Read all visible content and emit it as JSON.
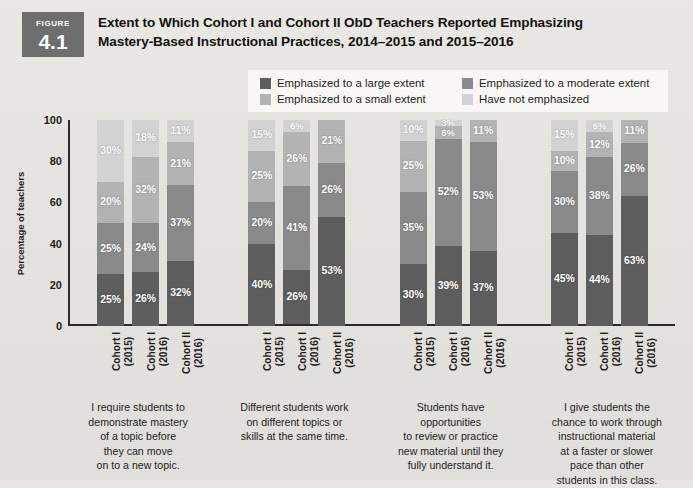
{
  "figure": {
    "badge_word": "FIGURE",
    "badge_number": "4.1",
    "title_line1": "Extent to Which Cohort I and Cohort II ObD Teachers Reported Emphasizing",
    "title_line2": "Mastery-Based Instructional Practices, 2014–2015 and 2015–2016"
  },
  "colors": {
    "large_extent": "#5d5d5d",
    "moderate_extent": "#8a8a8a",
    "small_extent": "#b4b4b4",
    "not_emphasized": "#d4d4d4",
    "axis": "#2a2a2a",
    "badge_bg": "#6e6e6e",
    "page_bg": "#e8e6e2",
    "legend_bg": "#fbfaf8",
    "label_text": "#ffffff"
  },
  "legend": {
    "items": [
      {
        "label": "Emphasized to a large extent",
        "color": "#5d5d5d",
        "swatch_name": "legend-swatch-large-extent"
      },
      {
        "label": "Emphasized to a moderate extent",
        "color": "#8a8a8a",
        "swatch_name": "legend-swatch-moderate-extent"
      },
      {
        "label": "Emphasized to a small extent",
        "color": "#b4b4b4",
        "swatch_name": "legend-swatch-small-extent"
      },
      {
        "label": "Have not emphasized",
        "color": "#d4d4d4",
        "swatch_name": "legend-swatch-not-emphasized"
      }
    ]
  },
  "chart_data": {
    "type": "bar",
    "subtype": "stacked-vertical-100",
    "title": "Extent to Which Cohort I and Cohort II ObD Teachers Reported Emphasizing Mastery-Based Instructional Practices, 2014–2015 and 2015–2016",
    "xlabel": "",
    "ylabel": "Percentage of teachers",
    "ylim": [
      0,
      100
    ],
    "yticks": [
      0,
      20,
      40,
      60,
      80,
      100
    ],
    "ytick_labels": [
      "0",
      "20",
      "40",
      "60",
      "80",
      "100"
    ],
    "grid": false,
    "legend_position": "top",
    "value_suffix": "%",
    "series": [
      {
        "name": "Emphasized to a large extent",
        "color": "#5d5d5d"
      },
      {
        "name": "Emphasized to a moderate extent",
        "color": "#8a8a8a"
      },
      {
        "name": "Emphasized to a small extent",
        "color": "#b4b4b4"
      },
      {
        "name": "Have not emphasized",
        "color": "#d4d4d4"
      }
    ],
    "categories": [
      "I require students to demonstrate mastery of a topic before they can move on to a new topic.",
      "Different students work on different topics or skills at the same time.",
      "Students have opportunities to review or practice new material until they fully understand it.",
      "I give students the chance to work through instructional material at a faster or slower pace than other students in this class."
    ],
    "category_caption_lines": [
      [
        "I require students to",
        "demonstrate mastery",
        "of a topic before",
        "they can move",
        "on to a new topic."
      ],
      [
        "Different students work",
        "on different topics or",
        "skills at the same time."
      ],
      [
        "Students have",
        "opportunities",
        "to review or practice",
        "new material until they",
        "fully understand it."
      ],
      [
        "I give students the",
        "chance to work through",
        "instructional material",
        "at a faster or slower",
        "pace than other",
        "students in this class."
      ]
    ],
    "cohort_labels": [
      {
        "line1": "Cohort I",
        "line2": "(2015)"
      },
      {
        "line1": "Cohort I",
        "line2": "(2016)"
      },
      {
        "line1": "Cohort II",
        "line2": "(2016)"
      }
    ],
    "groups": [
      {
        "category": "I require students to demonstrate mastery of a topic before they can move on to a new topic.",
        "bars": [
          {
            "cohort": "Cohort I (2015)",
            "values": [
              25,
              25,
              20,
              30
            ],
            "labels": [
              "25%",
              "25%",
              "20%",
              "30%"
            ]
          },
          {
            "cohort": "Cohort I (2016)",
            "values": [
              26,
              24,
              32,
              18
            ],
            "labels": [
              "26%",
              "24%",
              "32%",
              "18%"
            ]
          },
          {
            "cohort": "Cohort II (2016)",
            "values": [
              32,
              37,
              21,
              11
            ],
            "labels": [
              "32%",
              "37%",
              "21%",
              "11%"
            ]
          }
        ]
      },
      {
        "category": "Different students work on different topics or skills at the same time.",
        "bars": [
          {
            "cohort": "Cohort I (2015)",
            "values": [
              40,
              20,
              25,
              15
            ],
            "labels": [
              "40%",
              "20%",
              "25%",
              "15%"
            ]
          },
          {
            "cohort": "Cohort I (2016)",
            "values": [
              26,
              41,
              26,
              6
            ],
            "labels": [
              "26%",
              "41%",
              "26%",
              "6%"
            ]
          },
          {
            "cohort": "Cohort II (2016)",
            "values": [
              53,
              26,
              21,
              0
            ],
            "labels": [
              "53%",
              "26%",
              "21%",
              ""
            ]
          }
        ]
      },
      {
        "category": "Students have opportunities to review or practice new material until they fully understand it.",
        "bars": [
          {
            "cohort": "Cohort I (2015)",
            "values": [
              30,
              35,
              25,
              10
            ],
            "labels": [
              "30%",
              "35%",
              "25%",
              "10%"
            ]
          },
          {
            "cohort": "Cohort I (2016)",
            "values": [
              39,
              52,
              6,
              3
            ],
            "labels": [
              "39%",
              "52%",
              "6%",
              "3%"
            ]
          },
          {
            "cohort": "Cohort II (2016)",
            "values": [
              37,
              53,
              11,
              0
            ],
            "labels": [
              "37%",
              "53%",
              "11%",
              ""
            ]
          }
        ]
      },
      {
        "category": "I give students the chance to work through instructional material at a faster or slower pace than other students in this class.",
        "bars": [
          {
            "cohort": "Cohort I (2015)",
            "values": [
              45,
              30,
              10,
              15
            ],
            "labels": [
              "45%",
              "30%",
              "10%",
              "15%"
            ]
          },
          {
            "cohort": "Cohort I (2016)",
            "values": [
              44,
              38,
              12,
              6
            ],
            "labels": [
              "44%",
              "38%",
              "12%",
              "6%"
            ]
          },
          {
            "cohort": "Cohort II (2016)",
            "values": [
              63,
              26,
              11,
              0
            ],
            "labels": [
              "63%",
              "26%",
              "11%",
              ""
            ]
          }
        ]
      }
    ]
  }
}
